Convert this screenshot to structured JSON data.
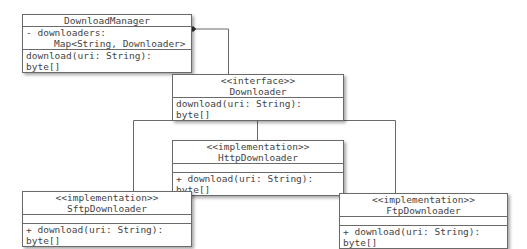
{
  "diagram": {
    "type": "uml-class-diagram",
    "classes": {
      "manager": {
        "name": "DownloadManager",
        "attributes": [
          "- downloaders:",
          "Map<String, Downloader>"
        ],
        "methods": [
          "download(uri: String): byte[]"
        ]
      },
      "iface": {
        "stereotype": "<<interface>>",
        "name": "Downloader",
        "methods": [
          "download(uri: String): byte[]"
        ]
      },
      "http": {
        "stereotype": "<<implementation>>",
        "name": "HttpDownloader",
        "methods": [
          "+ download(uri: String): byte[]"
        ]
      },
      "sftp": {
        "stereotype": "<<implementation>>",
        "name": "SftpDownloader",
        "methods": [
          "+ download(uri: String): byte[]"
        ]
      },
      "ftp": {
        "stereotype": "<<implementation>>",
        "name": "FtpDownloader",
        "methods": [
          "+ download(uri: String): byte[]"
        ]
      }
    },
    "relations": [
      {
        "type": "composition",
        "from": "DownloadManager",
        "to": "Downloader"
      },
      {
        "type": "realization",
        "from": "SftpDownloader",
        "to": "Downloader"
      },
      {
        "type": "realization",
        "from": "HttpDownloader",
        "to": "Downloader"
      },
      {
        "type": "realization",
        "from": "FtpDownloader",
        "to": "Downloader"
      }
    ],
    "colors": {
      "line": "#6a6a6a",
      "text": "#444444",
      "background": "#ffffff"
    }
  }
}
